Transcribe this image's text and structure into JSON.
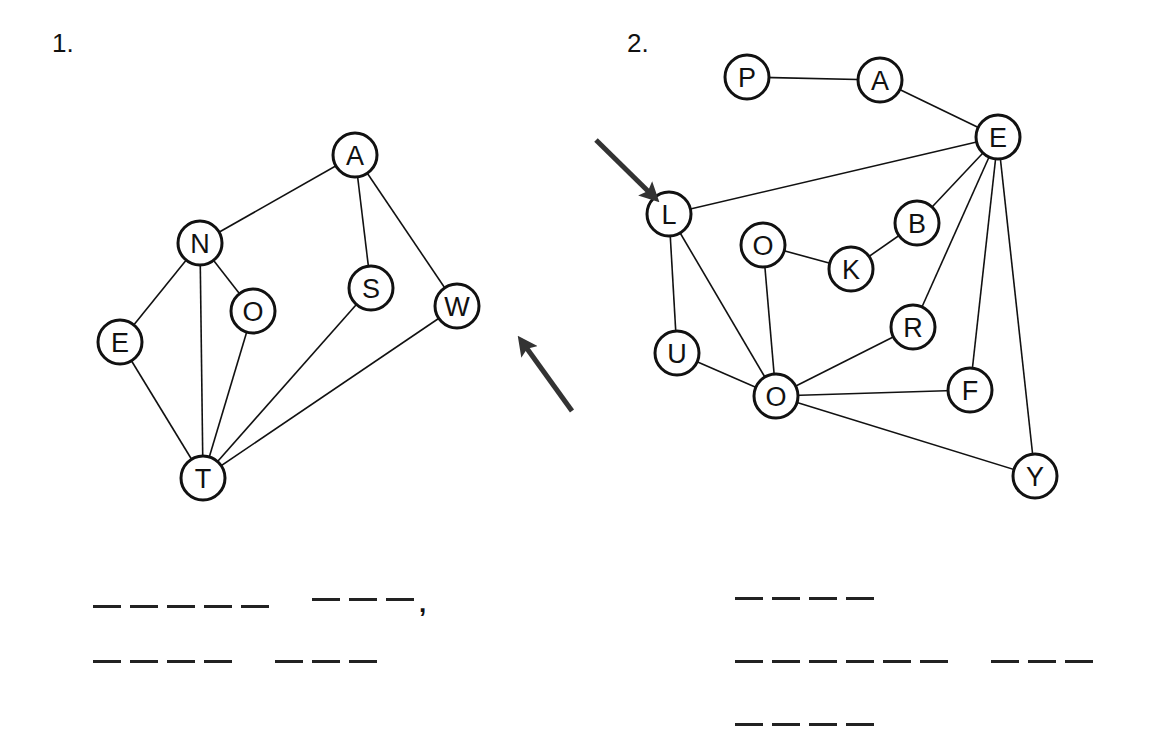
{
  "puzzles": [
    {
      "number_label": "1.",
      "nodes": [
        {
          "id": "A",
          "label": "A",
          "x": 355,
          "y": 155
        },
        {
          "id": "N",
          "label": "N",
          "x": 200,
          "y": 243
        },
        {
          "id": "E",
          "label": "E",
          "x": 120,
          "y": 342
        },
        {
          "id": "O",
          "label": "O",
          "x": 253,
          "y": 311
        },
        {
          "id": "S",
          "label": "S",
          "x": 371,
          "y": 288
        },
        {
          "id": "W",
          "label": "W",
          "x": 457,
          "y": 306
        },
        {
          "id": "T",
          "label": "T",
          "x": 203,
          "y": 478
        }
      ],
      "edges": [
        [
          "A",
          "N"
        ],
        [
          "A",
          "S"
        ],
        [
          "A",
          "W"
        ],
        [
          "N",
          "E"
        ],
        [
          "N",
          "O"
        ],
        [
          "N",
          "T"
        ],
        [
          "E",
          "T"
        ],
        [
          "O",
          "T"
        ],
        [
          "S",
          "T"
        ],
        [
          "W",
          "T"
        ]
      ],
      "start_arrow": {
        "points_to": "W",
        "from": [
          572,
          411
        ],
        "to": [
          523,
          343
        ]
      },
      "answer_blanks": [
        {
          "words": [
            5,
            3
          ],
          "trailing": ","
        },
        {
          "words": [
            4,
            3
          ],
          "trailing": ""
        }
      ]
    },
    {
      "number_label": "2.",
      "nodes": [
        {
          "id": "P",
          "label": "P",
          "x": 747,
          "y": 77
        },
        {
          "id": "A",
          "label": "A",
          "x": 880,
          "y": 80
        },
        {
          "id": "E",
          "label": "E",
          "x": 998,
          "y": 137
        },
        {
          "id": "L",
          "label": "L",
          "x": 669,
          "y": 214
        },
        {
          "id": "B",
          "label": "B",
          "x": 917,
          "y": 223
        },
        {
          "id": "O1",
          "label": "O",
          "x": 763,
          "y": 245
        },
        {
          "id": "K",
          "label": "K",
          "x": 851,
          "y": 269
        },
        {
          "id": "R",
          "label": "R",
          "x": 913,
          "y": 327
        },
        {
          "id": "U",
          "label": "U",
          "x": 677,
          "y": 353
        },
        {
          "id": "O2",
          "label": "O",
          "x": 776,
          "y": 396
        },
        {
          "id": "F",
          "label": "F",
          "x": 970,
          "y": 390
        },
        {
          "id": "Y",
          "label": "Y",
          "x": 1035,
          "y": 476
        }
      ],
      "edges": [
        [
          "P",
          "A"
        ],
        [
          "A",
          "E"
        ],
        [
          "E",
          "L"
        ],
        [
          "E",
          "B"
        ],
        [
          "E",
          "R"
        ],
        [
          "E",
          "F"
        ],
        [
          "E",
          "Y"
        ],
        [
          "B",
          "K"
        ],
        [
          "K",
          "O1"
        ],
        [
          "O1",
          "O2"
        ],
        [
          "L",
          "U"
        ],
        [
          "L",
          "O2"
        ],
        [
          "U",
          "O2"
        ],
        [
          "O2",
          "R"
        ],
        [
          "O2",
          "F"
        ],
        [
          "O2",
          "Y"
        ]
      ],
      "start_arrow": {
        "points_to": "L",
        "from": [
          596,
          140
        ],
        "to": [
          653,
          196
        ]
      },
      "answer_blanks": [
        {
          "words": [
            4
          ],
          "trailing": ""
        },
        {
          "words": [
            6,
            3
          ],
          "trailing": ""
        },
        {
          "words": [
            4
          ],
          "trailing": ""
        }
      ]
    }
  ],
  "style": {
    "ink_color": "#111111",
    "arrow_color": "#333333",
    "background": "#ffffff"
  }
}
